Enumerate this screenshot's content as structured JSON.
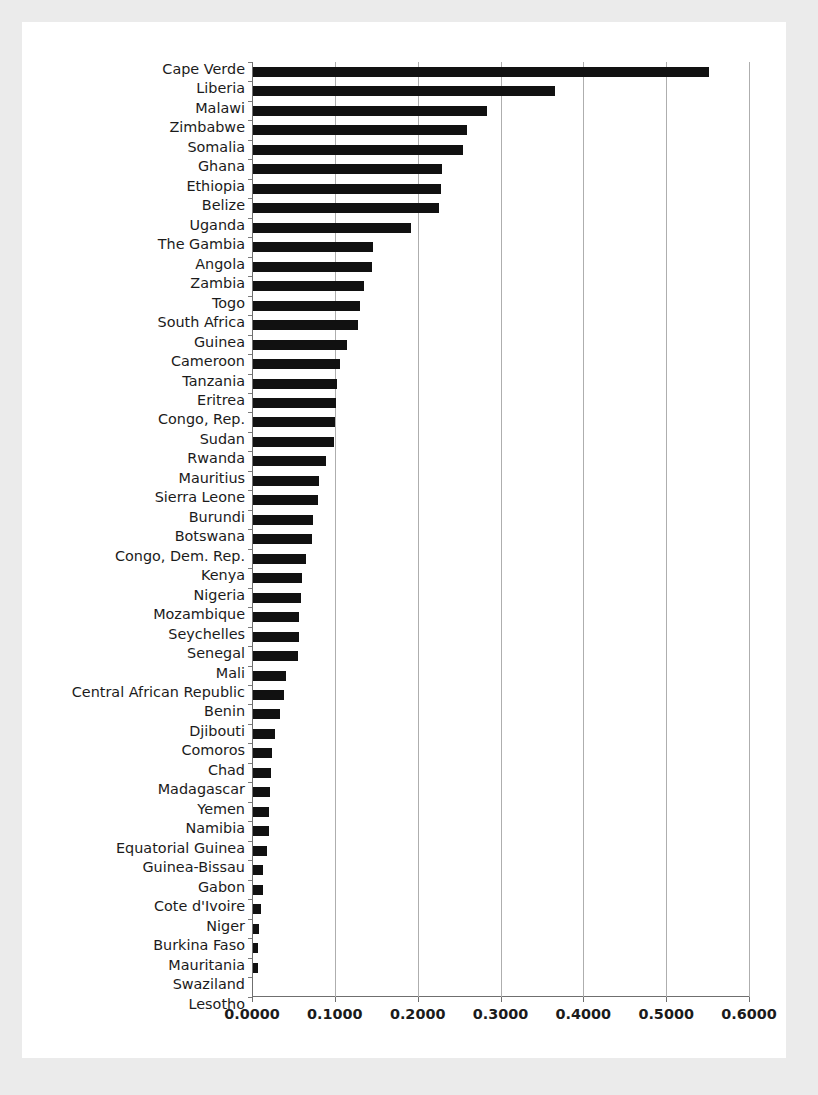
{
  "chart_data": {
    "type": "bar",
    "orientation": "horizontal",
    "title": "",
    "subtitle": "",
    "xlabel": "",
    "ylabel": "",
    "xlim": [
      0.0,
      0.6
    ],
    "xticks": [
      0.0,
      0.1,
      0.2,
      0.3,
      0.4,
      0.5,
      0.6
    ],
    "xtick_labels": [
      "0.0000",
      "0.1000",
      "0.2000",
      "0.3000",
      "0.4000",
      "0.5000",
      "0.6000"
    ],
    "grid": "vertical",
    "legend": "none",
    "bar_color": "#111111",
    "gridline_color": "#aeaeae",
    "axis_color": "#6f6f6f",
    "panel_background": "#ffffff",
    "page_background": "#ebebeb",
    "categories": [
      "Cape Verde",
      "Liberia",
      "Malawi",
      "Zimbabwe",
      "Somalia",
      "Ghana",
      "Ethiopia",
      "Belize",
      "Uganda",
      "The Gambia",
      "Angola",
      "Zambia",
      "Togo",
      "South Africa",
      "Guinea",
      "Cameroon",
      "Tanzania",
      "Eritrea",
      "Congo, Rep.",
      "Sudan",
      "Rwanda",
      "Mauritius",
      "Sierra Leone",
      "Burundi",
      "Botswana",
      "Congo, Dem. Rep.",
      "Kenya",
      "Nigeria",
      "Mozambique",
      "Seychelles",
      "Senegal",
      "Mali",
      "Central African Republic",
      "Benin",
      "Djibouti",
      "Comoros",
      "Chad",
      "Madagascar",
      "Yemen",
      "Namibia",
      "Equatorial Guinea",
      "Guinea-Bissau",
      "Gabon",
      "Cote d'Ivoire",
      "Niger",
      "Burkina Faso",
      "Mauritania",
      "Swaziland",
      "Lesotho"
    ],
    "values": [
      0.55,
      0.365,
      0.282,
      0.258,
      0.254,
      0.228,
      0.227,
      0.225,
      0.191,
      0.145,
      0.144,
      0.134,
      0.129,
      0.127,
      0.114,
      0.105,
      0.102,
      0.1,
      0.0995,
      0.098,
      0.088,
      0.08,
      0.078,
      0.072,
      0.071,
      0.064,
      0.059,
      0.058,
      0.056,
      0.055,
      0.054,
      0.04,
      0.037,
      0.032,
      0.026,
      0.023,
      0.0215,
      0.02,
      0.0195,
      0.019,
      0.0175,
      0.012,
      0.0115,
      0.01,
      0.0075,
      0.006,
      0.0055,
      0.0,
      0.0
    ]
  }
}
